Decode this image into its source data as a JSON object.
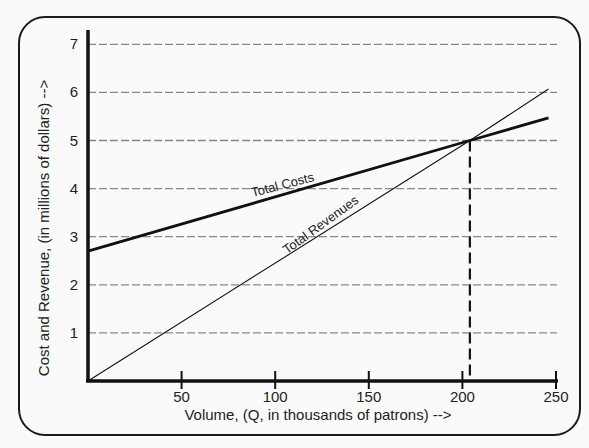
{
  "chart_data": {
    "type": "line",
    "title": "",
    "xlabel": "Volume, (Q, in thousands of patrons) -->",
    "ylabel": "Cost and Revenue, (in millions of dollars) -->",
    "xlim": [
      0,
      250
    ],
    "ylim": [
      0,
      7
    ],
    "x_ticks": [
      50,
      100,
      150,
      200,
      250
    ],
    "y_ticks": [
      1,
      2,
      3,
      4,
      5,
      6,
      7
    ],
    "grid": "horizontal dotted",
    "legend": "inline labels",
    "series": [
      {
        "name": "Total Costs",
        "x": [
          0,
          204,
          246
        ],
        "values": [
          2.7,
          5.0,
          5.47
        ],
        "style": "thick solid"
      },
      {
        "name": "Total Revenues",
        "x": [
          0,
          204,
          246
        ],
        "values": [
          0,
          5.0,
          6.07
        ],
        "style": "thin solid"
      }
    ],
    "annotations": [
      {
        "type": "dashed-vertical",
        "x": 204,
        "y_from": 0,
        "y_to": 5.0,
        "note": "break-even point"
      }
    ]
  },
  "labels": {
    "total_costs": "Total Costs",
    "total_revenues": "Total Revenues"
  }
}
